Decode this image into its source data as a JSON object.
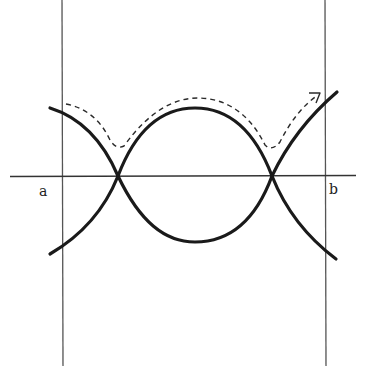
{
  "diagram": {
    "colors": {
      "background": "#ffffff",
      "boundary_line": "#444444",
      "axis": "#333333",
      "curve": "#1a1a1a",
      "dashed_path": "#2a2a2a"
    },
    "labels": {
      "left": "a",
      "right": "b"
    },
    "elements": {
      "left_boundary": {
        "x": 62,
        "y1": 0,
        "y2": 366
      },
      "right_boundary": {
        "x": 325,
        "y1": 0,
        "y2": 366
      },
      "axis": {
        "y": 176,
        "x1": 10,
        "x2": 356
      },
      "crossings": [
        {
          "x": 118,
          "y": 176
        },
        {
          "x": 272,
          "y": 176
        }
      ],
      "upper_arc_peak": {
        "x": 195,
        "y": 108
      },
      "lower_arc_trough": {
        "x": 195,
        "y": 242
      },
      "dashed_path_arrow": {
        "x": 320,
        "y": 93,
        "direction": "up-right"
      }
    }
  }
}
